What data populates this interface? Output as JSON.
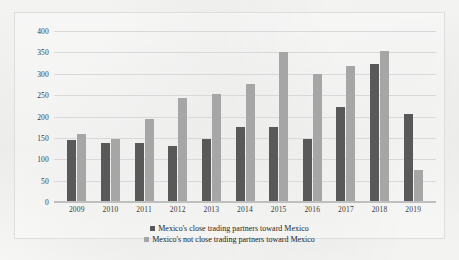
{
  "chart_data": {
    "type": "bar",
    "title": "",
    "subtitle": "",
    "xlabel": "",
    "ylabel": "",
    "ylim": [
      0,
      400
    ],
    "yticks": [
      0,
      50,
      100,
      150,
      200,
      250,
      300,
      350,
      400
    ],
    "grid": true,
    "legend_position": "bottom",
    "categories": [
      "2009",
      "2010",
      "2011",
      "2012",
      "2013",
      "2014",
      "2015",
      "2016",
      "2017",
      "2018",
      "2019"
    ],
    "series": [
      {
        "name": "Mexico's close trading partners toward Mexico",
        "color": "#595959",
        "values": [
          146,
          138,
          137,
          132,
          148,
          175,
          176,
          148,
          222,
          323,
          205
        ]
      },
      {
        "name": "Mexico's not close trading partners toward Mexico",
        "color": "#a6a6a6",
        "values": [
          158,
          148,
          195,
          244,
          252,
          276,
          352,
          299,
          318,
          353,
          75
        ]
      }
    ]
  },
  "legend": {
    "items": [
      {
        "label": "Mexico's close trading partners toward Mexico",
        "swatch": "series-close"
      },
      {
        "label": "Mexico's not close trading partners toward Mexico",
        "swatch": "series-notclose"
      }
    ]
  }
}
